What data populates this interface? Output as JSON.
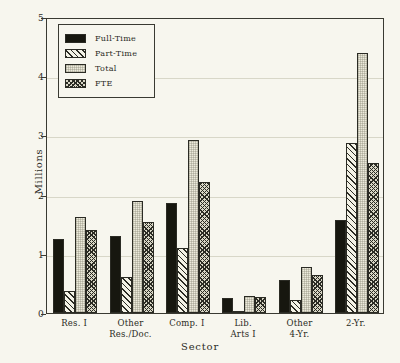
{
  "chart_data": {
    "type": "bar",
    "title": "",
    "xlabel": "Sector",
    "ylabel": "Millions",
    "ylim": [
      0,
      5
    ],
    "yticks": [
      0,
      1,
      2,
      3,
      4,
      5
    ],
    "ytick_labels": [
      "0",
      "1",
      "2",
      "3",
      "4",
      "5"
    ],
    "grid": true,
    "legend_position": "upper left",
    "categories": [
      "Res. I",
      "Other Res./Doc.",
      "Comp. I",
      "Lib. Arts I",
      "Other 4-Yr.",
      "2-Yr."
    ],
    "category_lines": [
      [
        "Res. I"
      ],
      [
        "Other",
        "Res./Doc."
      ],
      [
        "Comp. I"
      ],
      [
        "Lib.",
        "Arts I"
      ],
      [
        "Other",
        "4-Yr."
      ],
      [
        "2-Yr."
      ]
    ],
    "series": [
      {
        "name": "Full-Time",
        "fill": "solid",
        "values": [
          1.25,
          1.3,
          1.85,
          0.26,
          0.55,
          1.57
        ]
      },
      {
        "name": "Part-Time",
        "fill": "diag",
        "values": [
          0.38,
          0.6,
          1.1,
          0.03,
          0.22,
          2.88
        ]
      },
      {
        "name": "Total",
        "fill": "light",
        "values": [
          1.62,
          1.9,
          2.93,
          0.29,
          0.77,
          4.4
        ]
      },
      {
        "name": "FTE",
        "fill": "cross",
        "values": [
          1.4,
          1.53,
          2.21,
          0.27,
          0.65,
          2.53
        ]
      }
    ]
  },
  "colors": {
    "background": "#f7f6ee",
    "axis": "#2b2b24",
    "gridline": "#d8d7c8",
    "full_time": "#17170f",
    "part_time": "#f3f2e6",
    "total": "#eceadb",
    "fte": "#d9d7c6"
  }
}
